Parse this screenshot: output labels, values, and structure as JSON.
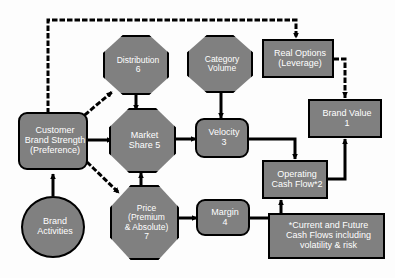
{
  "diagram": {
    "colors": {
      "node_fill": "#808080",
      "node_border": "#000000",
      "node_text": "#ffffff",
      "background": "#fdfdfd",
      "connector": "#000000"
    },
    "nodes": [
      {
        "id": "customer-brand-strength",
        "shape": "rounded-rectangle",
        "label": "Customer Brand Strength (Preference)",
        "lines": [
          "Customer",
          "Brand Strength",
          "(Preference)"
        ]
      },
      {
        "id": "brand-activities",
        "shape": "circle",
        "label": "Brand Activities",
        "lines": [
          "Brand",
          "Activities"
        ]
      },
      {
        "id": "distribution",
        "shape": "octagon",
        "label": "Distribution 6",
        "lines": [
          "Distribution",
          "6"
        ],
        "number": "6"
      },
      {
        "id": "category-volume",
        "shape": "octagon",
        "label": "Category Volume",
        "lines": [
          "Category",
          "Volume"
        ]
      },
      {
        "id": "market-share",
        "shape": "octagon",
        "label": "Market Share 5",
        "lines": [
          "Market",
          "Share 5"
        ],
        "number": "5"
      },
      {
        "id": "price",
        "shape": "octagon",
        "label": "Price (Premium & Absolute) 7",
        "lines": [
          "Price",
          "(Premium",
          "& Absolute)",
          "7"
        ],
        "number": "7"
      },
      {
        "id": "velocity",
        "shape": "rounded-rectangle",
        "label": "Velocity 3",
        "lines": [
          "Velocity",
          "3"
        ],
        "number": "3"
      },
      {
        "id": "margin",
        "shape": "rounded-rectangle",
        "label": "Margin 4",
        "lines": [
          "Margin",
          "4"
        ],
        "number": "4"
      },
      {
        "id": "operating-cash-flow",
        "shape": "rectangle",
        "label": "Operating Cash Flow*2",
        "lines": [
          "Operating",
          "Cash Flow*2"
        ],
        "number": "2"
      },
      {
        "id": "real-options",
        "shape": "rectangle",
        "label": "Real Options (Leverage)",
        "lines": [
          "Real Options",
          "(Leverage)"
        ]
      },
      {
        "id": "brand-value",
        "shape": "rectangle",
        "label": "Brand Value 1",
        "lines": [
          "Brand Value",
          "1"
        ],
        "number": "1"
      },
      {
        "id": "footnote",
        "shape": "rectangle",
        "label": "*Current and Future Cash Flows including volatility & risk",
        "lines": [
          "*Current and Future",
          "Cash Flows including",
          "volatility & risk"
        ]
      }
    ],
    "connectors": [
      {
        "from": "brand-activities",
        "to": "customer-brand-strength",
        "style": "solid"
      },
      {
        "from": "customer-brand-strength",
        "to": "market-share",
        "style": "solid"
      },
      {
        "from": "customer-brand-strength",
        "to": "distribution",
        "style": "dotted"
      },
      {
        "from": "customer-brand-strength",
        "to": "price",
        "style": "dotted"
      },
      {
        "from": "customer-brand-strength",
        "to": "real-options",
        "style": "dotted"
      },
      {
        "from": "distribution",
        "to": "market-share",
        "style": "solid"
      },
      {
        "from": "category-volume",
        "to": "velocity",
        "style": "solid"
      },
      {
        "from": "market-share",
        "to": "velocity",
        "style": "solid"
      },
      {
        "from": "price",
        "to": "market-share",
        "style": "solid"
      },
      {
        "from": "price",
        "to": "margin",
        "style": "solid"
      },
      {
        "from": "velocity",
        "to": "operating-cash-flow",
        "style": "solid"
      },
      {
        "from": "margin",
        "to": "operating-cash-flow",
        "style": "solid"
      },
      {
        "from": "operating-cash-flow",
        "to": "brand-value",
        "style": "solid"
      },
      {
        "from": "real-options",
        "to": "brand-value",
        "style": "dotted"
      }
    ]
  }
}
